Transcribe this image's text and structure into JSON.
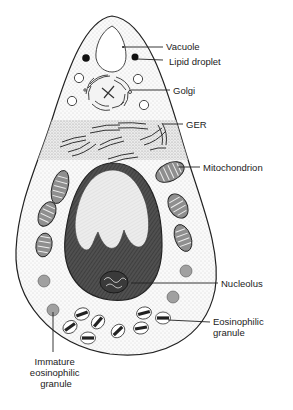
{
  "diagram": {
    "labels": {
      "vacuole": "Vacuole",
      "lipid_droplet": "Lipid droplet",
      "golgi": "Golgi",
      "ger": "GER",
      "mitochondrion": "Mitochondrion",
      "nucleolus": "Nucleolus",
      "eosinophilic_granule": [
        "Eosinophilic",
        "granule"
      ],
      "immature_granule": [
        "Immature",
        "eosinophilic",
        "granule"
      ]
    },
    "colors": {
      "outline": "#222222",
      "cytoplasm_stipple": "#bdbdbd",
      "nucleus_dark": "#4a4a4a",
      "nucleus_light": "#e6e6e6",
      "organelle_grey": "#9a9a9a",
      "background": "#ffffff"
    }
  }
}
